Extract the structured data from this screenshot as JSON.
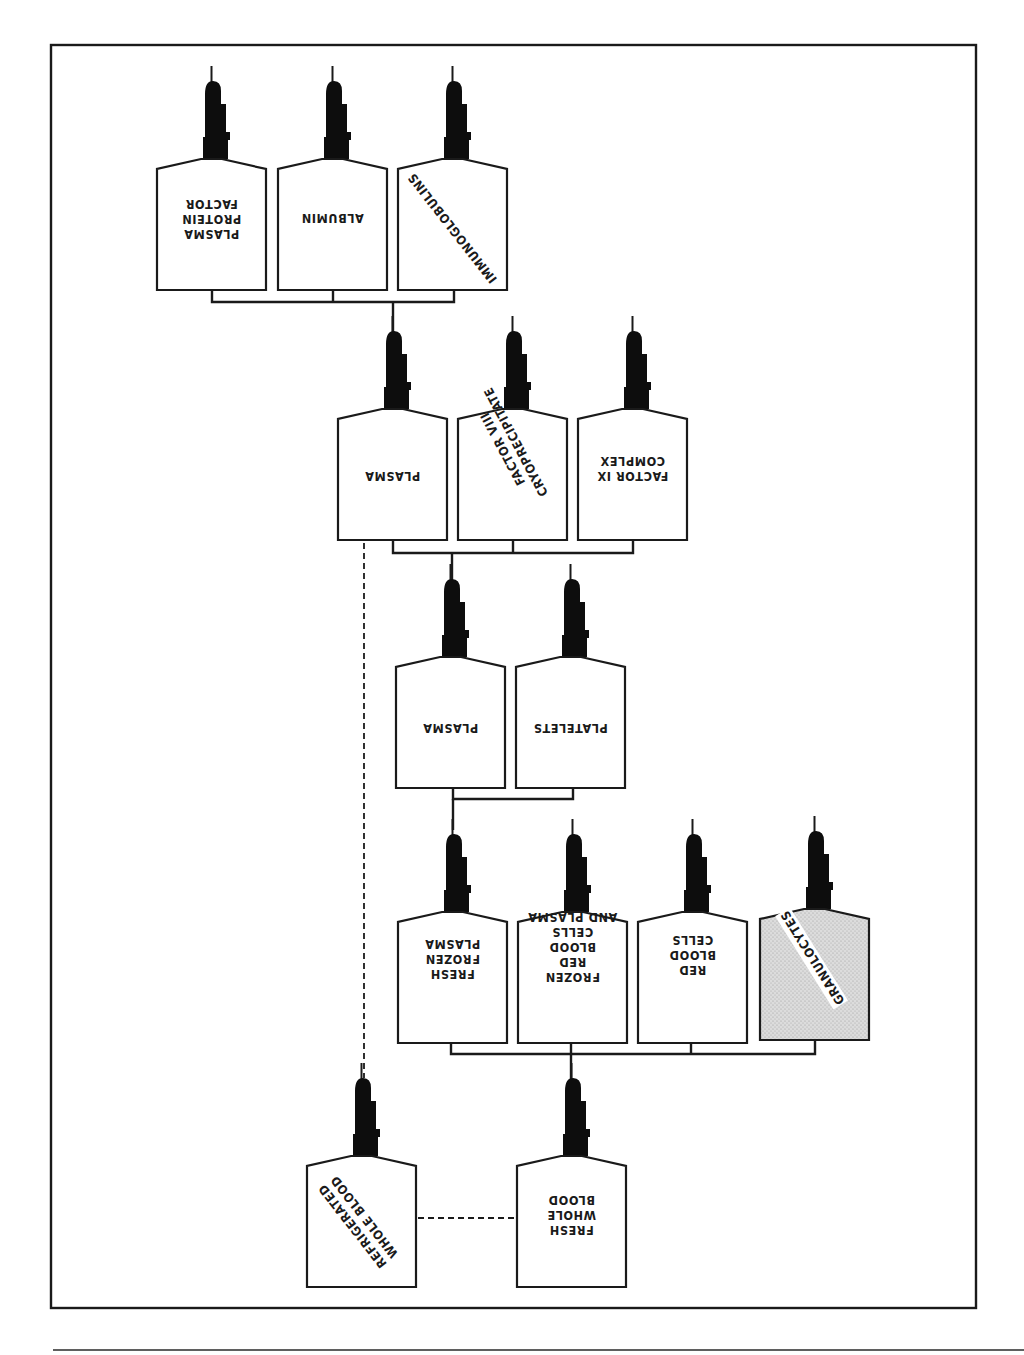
{
  "diagram": {
    "type": "blood-component-derivation-tree",
    "orientation_note": "printed upside down (rotated 180deg)",
    "colors": {
      "line": "#1a1a1a",
      "cap": "#0d0d0d",
      "shaded_fill": "#d8d8d8",
      "background": "#ffffff"
    },
    "row1": {
      "plasma_protein_factor": {
        "lines": [
          "PLASMA",
          "PROTEIN",
          "FACTOR"
        ]
      },
      "albumin": {
        "lines": [
          "ALBUMIN"
        ]
      },
      "immunoglobulins": {
        "lines": [
          "IMMUNOGLOBULINS"
        ]
      }
    },
    "row2": {
      "plasma": {
        "lines": [
          "PLASMA"
        ]
      },
      "factor_viii": {
        "lines": [
          "FACTOR VIII",
          "CRYOPRECIPITATE"
        ]
      },
      "factor_ix": {
        "lines": [
          "FACTOR IX",
          "COMPLEX"
        ]
      }
    },
    "row3": {
      "plasma": {
        "lines": [
          "PLASMA"
        ]
      },
      "platelets": {
        "lines": [
          "PLATELETS"
        ]
      }
    },
    "row4": {
      "fresh_frozen_plasma": {
        "lines": [
          "FRESH",
          "FROZEN",
          "PLASMA"
        ]
      },
      "frozen_rbc_plasma": {
        "lines": [
          "FROZEN",
          "RED",
          "BLOOD",
          "CELLS",
          "AND PLASMA"
        ]
      },
      "red_blood_cells": {
        "lines": [
          "RED",
          "BLOOD",
          "CELLS"
        ]
      },
      "granulocytes": {
        "lines": [
          "GRANULOCYTES"
        ],
        "shaded": true
      }
    },
    "row5": {
      "refrigerated_whole_blood": {
        "lines": [
          "REFRIGERATED",
          "WHOLE BLOOD"
        ]
      },
      "fresh_whole_blood": {
        "lines": [
          "FRESH",
          "WHOLE",
          "BLOOD"
        ]
      }
    }
  }
}
